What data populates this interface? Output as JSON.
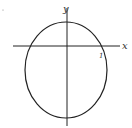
{
  "diagram": {
    "type": "ellipse-on-axes",
    "labels": {
      "y_axis": "y",
      "x_axis": "x",
      "tick": "1"
    },
    "colors": {
      "stroke": "#222222",
      "background": "#ffffff"
    }
  }
}
